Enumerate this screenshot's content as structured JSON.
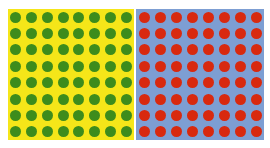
{
  "figure": {
    "canvas_background": "#ffffff",
    "panel_count": 2
  },
  "chart_data": {
    "type": "heatmap",
    "subtitle": "",
    "xlabel": "",
    "ylabel": "",
    "grid": true,
    "legend_position": "none",
    "tick_labels_x": [],
    "tick_labels_y": [],
    "annotations": [],
    "panels": [
      {
        "name": "left-panel",
        "background_color": "#f5e619",
        "dot_color": "#3d8c1c",
        "dot_label": "green-dot",
        "rows": 8,
        "columns": 8,
        "dot_count": 64,
        "values": [
          [
            1,
            1,
            1,
            1,
            1,
            1,
            1,
            1
          ],
          [
            1,
            1,
            1,
            1,
            1,
            1,
            1,
            1
          ],
          [
            1,
            1,
            1,
            1,
            1,
            1,
            1,
            1
          ],
          [
            1,
            1,
            1,
            1,
            1,
            1,
            1,
            1
          ],
          [
            1,
            1,
            1,
            1,
            1,
            1,
            1,
            1
          ],
          [
            1,
            1,
            1,
            1,
            1,
            1,
            1,
            1
          ],
          [
            1,
            1,
            1,
            1,
            1,
            1,
            1,
            1
          ],
          [
            1,
            1,
            1,
            1,
            1,
            1,
            1,
            1
          ]
        ]
      },
      {
        "name": "right-panel",
        "background_color": "#7d9ed3",
        "dot_color": "#d8290f",
        "dot_label": "red-dot",
        "rows": 8,
        "columns": 8,
        "dot_count": 64,
        "values": [
          [
            1,
            1,
            1,
            1,
            1,
            1,
            1,
            1
          ],
          [
            1,
            1,
            1,
            1,
            1,
            1,
            1,
            1
          ],
          [
            1,
            1,
            1,
            1,
            1,
            1,
            1,
            1
          ],
          [
            1,
            1,
            1,
            1,
            1,
            1,
            1,
            1
          ],
          [
            1,
            1,
            1,
            1,
            1,
            1,
            1,
            1
          ],
          [
            1,
            1,
            1,
            1,
            1,
            1,
            1,
            1
          ],
          [
            1,
            1,
            1,
            1,
            1,
            1,
            1,
            1
          ],
          [
            1,
            1,
            1,
            1,
            1,
            1,
            1,
            1
          ]
        ]
      }
    ]
  }
}
